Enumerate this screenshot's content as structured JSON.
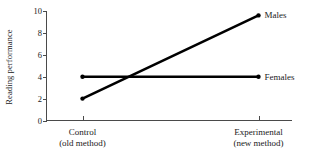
{
  "chart_data": {
    "type": "line",
    "title": "",
    "subtitle": "",
    "xlabel": "",
    "ylabel": "Reading performance",
    "categories": [
      "Control\n(old method)",
      "Experimental\n(new method)"
    ],
    "x_tick_labels": [
      {
        "line1": "Control",
        "line2": "(old method)"
      },
      {
        "line1": "Experimental",
        "line2": "(new method)"
      }
    ],
    "y_ticks": [
      0,
      2,
      4,
      6,
      8,
      10
    ],
    "y_tick_labels": [
      "0",
      "2",
      "4",
      "6",
      "8",
      "10"
    ],
    "ylim": [
      0,
      10
    ],
    "xlim": [
      0,
      1
    ],
    "grid": false,
    "legend_position": "right-inline-labels",
    "series": [
      {
        "name": "Males",
        "label": "Males",
        "values": [
          2,
          9.6
        ],
        "color": "#000000",
        "marker": "circle"
      },
      {
        "name": "Females",
        "label": "Females",
        "values": [
          4,
          4
        ],
        "color": "#000000",
        "marker": "circle"
      }
    ],
    "annotations": [
      {
        "text": "Males",
        "x": 1,
        "y": 9.6
      },
      {
        "text": "Females",
        "x": 1,
        "y": 4
      }
    ],
    "colors": {
      "line": "#000000",
      "axis": "#4a4a4a",
      "text": "#1a1a1a",
      "background": "#ffffff"
    }
  }
}
